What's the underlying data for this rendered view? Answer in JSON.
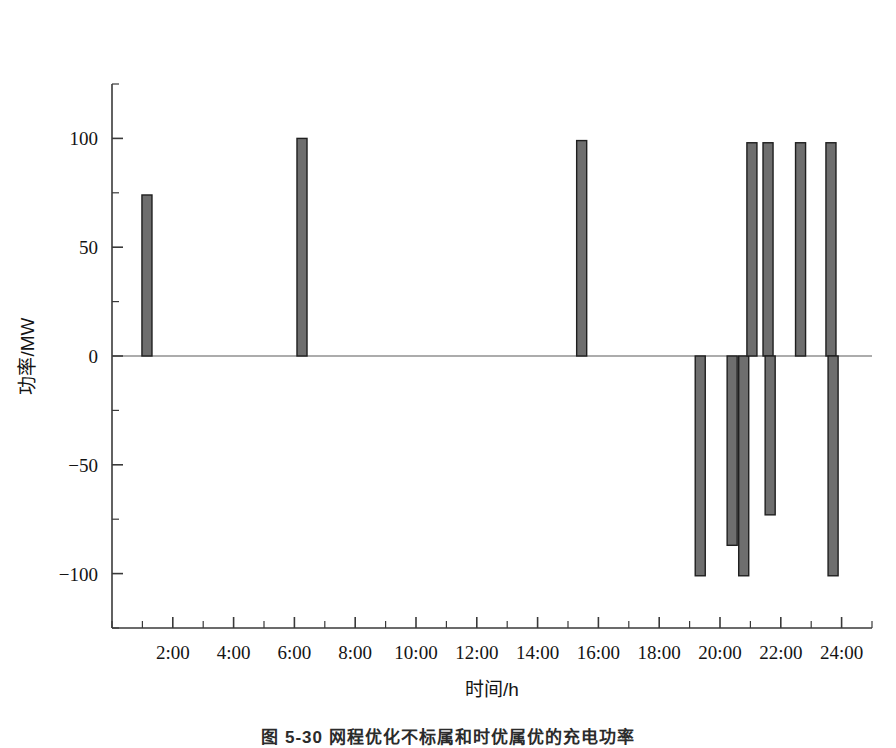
{
  "figure": {
    "caption": "图 5-30  网程优化不标属和时优属优的充电功率"
  },
  "chart_data": {
    "type": "bar",
    "title": "",
    "xlabel": "时间/h",
    "ylabel": "功率/MW",
    "xlim": [
      0,
      25
    ],
    "ylim": [
      -125,
      125
    ],
    "grid": false,
    "legend": "none",
    "bar_fill": "#6e6e6e",
    "bar_stroke": "#1f1f1f",
    "axis_color": "#3a3a3a",
    "xticks": [
      2,
      4,
      6,
      8,
      10,
      12,
      14,
      16,
      18,
      20,
      22,
      24
    ],
    "xtick_labels": [
      "2:00",
      "4:00",
      "6:00",
      "8:00",
      "10:00",
      "12:00",
      "14:00",
      "16:00",
      "18:00",
      "20:00",
      "22:00",
      "24:00"
    ],
    "x_minor_step": 1,
    "yticks": [
      -100,
      -50,
      0,
      50,
      100
    ],
    "ytick_labels": [
      "-100",
      "-50",
      "0",
      "50",
      "100"
    ],
    "y_minor_step": 25,
    "bar_width_hours": 0.33,
    "bars": [
      {
        "x": 1.15,
        "y": 74
      },
      {
        "x": 6.25,
        "y": 100
      },
      {
        "x": 15.45,
        "y": 99
      },
      {
        "x": 19.35,
        "y": -101
      },
      {
        "x": 20.4,
        "y": -87
      },
      {
        "x": 20.78,
        "y": -101
      },
      {
        "x": 21.05,
        "y": 98
      },
      {
        "x": 21.58,
        "y": 98
      },
      {
        "x": 21.65,
        "y": -73
      },
      {
        "x": 22.65,
        "y": 98
      },
      {
        "x": 23.65,
        "y": 98
      },
      {
        "x": 23.72,
        "y": -101
      }
    ]
  }
}
